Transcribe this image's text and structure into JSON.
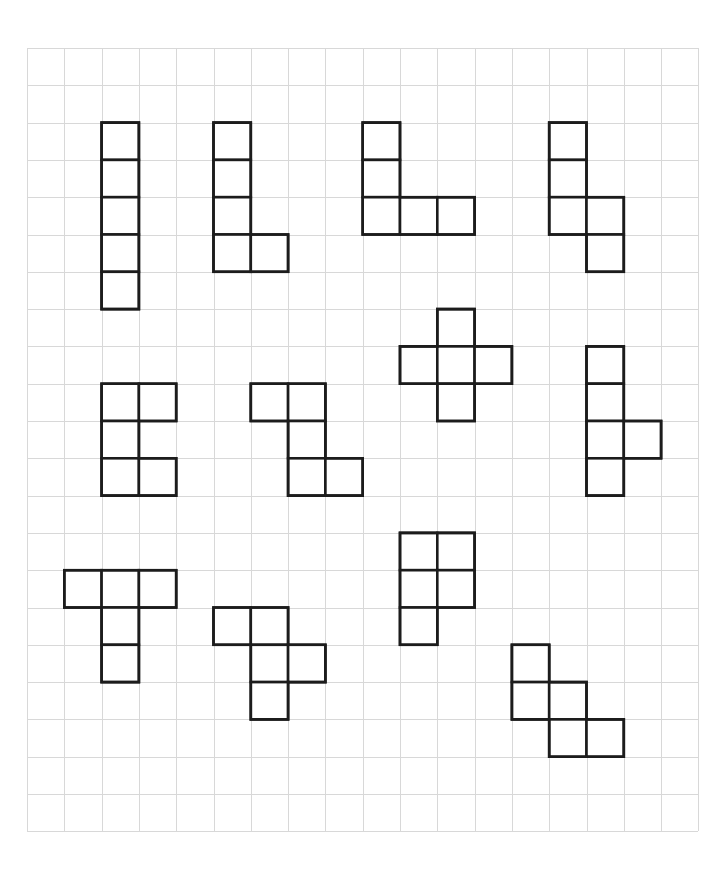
{
  "canvas": {
    "width": 726,
    "height": 887,
    "background": "#ffffff",
    "title": "Pentomino worksheet grid"
  },
  "grid": {
    "name": "graph-paper-grid",
    "origin_x": 27,
    "origin_y": 48,
    "cell_size": 37.3,
    "cols": 18,
    "rows": 21,
    "line_color": "#d8d8d8",
    "line_width": 1
  },
  "shape_style": {
    "stroke_color": "#1c1c1c",
    "stroke_width": 2.6,
    "fill_color": "#ffffff"
  },
  "chart_data": {
    "type": "table",
    "xlabel": "grid column",
    "ylabel": "grid row",
    "grid": true,
    "axis_ranges": {
      "x": [
        0,
        18
      ],
      "y": [
        0,
        21
      ]
    },
    "note": "Twelve pentomino pieces drawn on graph paper; each piece is five unit squares. Cells listed as [col,row] in grid units from the grid origin.",
    "shapes": [
      {
        "id": 1,
        "label": "I-pentomino",
        "cells": [
          [
            2,
            2
          ],
          [
            2,
            3
          ],
          [
            2,
            4
          ],
          [
            2,
            5
          ],
          [
            2,
            6
          ]
        ]
      },
      {
        "id": 2,
        "label": "L-pentomino",
        "cells": [
          [
            5,
            2
          ],
          [
            5,
            3
          ],
          [
            5,
            4
          ],
          [
            5,
            5
          ],
          [
            6,
            5
          ]
        ]
      },
      {
        "id": 3,
        "label": "V-pentomino",
        "cells": [
          [
            9,
            2
          ],
          [
            9,
            3
          ],
          [
            9,
            4
          ],
          [
            10,
            4
          ],
          [
            11,
            4
          ]
        ]
      },
      {
        "id": 4,
        "label": "N-pentomino",
        "cells": [
          [
            14,
            2
          ],
          [
            14,
            3
          ],
          [
            14,
            4
          ],
          [
            15,
            4
          ],
          [
            15,
            5
          ]
        ]
      },
      {
        "id": 5,
        "label": "X-pentomino",
        "cells": [
          [
            11,
            7
          ],
          [
            10,
            8
          ],
          [
            11,
            8
          ],
          [
            12,
            8
          ],
          [
            11,
            9
          ]
        ]
      },
      {
        "id": 6,
        "label": "U-pentomino",
        "cells": [
          [
            2,
            9
          ],
          [
            3,
            9
          ],
          [
            2,
            10
          ],
          [
            2,
            11
          ],
          [
            3,
            11
          ]
        ]
      },
      {
        "id": 7,
        "label": "W-pentomino",
        "cells": [
          [
            6,
            9
          ],
          [
            7,
            9
          ],
          [
            7,
            10
          ],
          [
            7,
            11
          ],
          [
            8,
            11
          ]
        ]
      },
      {
        "id": 8,
        "label": "Y-pentomino",
        "cells": [
          [
            15,
            8
          ],
          [
            15,
            9
          ],
          [
            15,
            10
          ],
          [
            16,
            10
          ],
          [
            15,
            11
          ]
        ]
      },
      {
        "id": 9,
        "label": "T-pentomino",
        "cells": [
          [
            1,
            14
          ],
          [
            2,
            14
          ],
          [
            3,
            14
          ],
          [
            2,
            15
          ],
          [
            2,
            16
          ]
        ]
      },
      {
        "id": 10,
        "label": "F-pentomino",
        "cells": [
          [
            5,
            15
          ],
          [
            6,
            15
          ],
          [
            6,
            16
          ],
          [
            7,
            16
          ],
          [
            6,
            17
          ]
        ]
      },
      {
        "id": 11,
        "label": "P-pentomino",
        "cells": [
          [
            10,
            13
          ],
          [
            11,
            13
          ],
          [
            10,
            14
          ],
          [
            11,
            14
          ],
          [
            10,
            15
          ]
        ]
      },
      {
        "id": 12,
        "label": "W-pentomino",
        "cells": [
          [
            13,
            16
          ],
          [
            13,
            17
          ],
          [
            14,
            17
          ],
          [
            14,
            18
          ],
          [
            15,
            18
          ]
        ]
      }
    ]
  }
}
